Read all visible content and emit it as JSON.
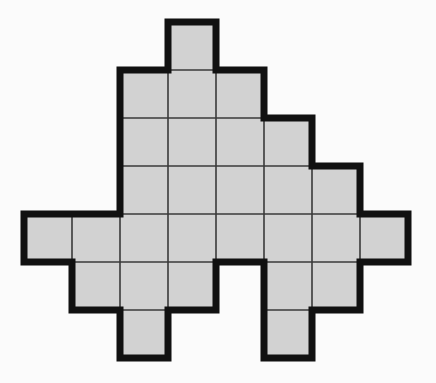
{
  "canvas": {
    "width": 436,
    "height": 383,
    "background_color": "#fbfbfb"
  },
  "figure": {
    "cell_fill_color": "#d2d2d2",
    "outline_color": "#111111",
    "interior_line_color": "#3a3a3a",
    "outline_width": 7,
    "interior_line_width": 1.6,
    "cell_size": 48,
    "origin_x": 24,
    "origin_y": 22,
    "columns": 8,
    "rows": 7,
    "cell_count": 26
  },
  "grid_data": {
    "type": "occupancy-matrix",
    "legend": {
      "1": "filled cell",
      "0": "empty cell"
    },
    "column_labels": [
      "0",
      "1",
      "2",
      "3",
      "4",
      "5",
      "6",
      "7"
    ],
    "row_labels": [
      "0",
      "1",
      "2",
      "3",
      "4",
      "5",
      "6"
    ],
    "matrix": [
      [
        0,
        0,
        0,
        1,
        0,
        0,
        0,
        0
      ],
      [
        0,
        0,
        1,
        1,
        1,
        0,
        0,
        0
      ],
      [
        0,
        0,
        1,
        1,
        1,
        1,
        0,
        0
      ],
      [
        0,
        0,
        1,
        1,
        1,
        1,
        1,
        0
      ],
      [
        1,
        1,
        1,
        1,
        1,
        1,
        1,
        1
      ],
      [
        0,
        1,
        1,
        1,
        0,
        1,
        1,
        0
      ],
      [
        0,
        0,
        1,
        0,
        0,
        1,
        0,
        0
      ]
    ],
    "row_filled_columns": [
      [
        3
      ],
      [
        2,
        3,
        4
      ],
      [
        2,
        3,
        4,
        5
      ],
      [
        2,
        3,
        4,
        5,
        6
      ],
      [
        0,
        1,
        2,
        3,
        4,
        5,
        6,
        7
      ],
      [
        1,
        2,
        3,
        5,
        6
      ],
      [
        2,
        5
      ]
    ],
    "row_counts": [
      1,
      3,
      4,
      5,
      8,
      5,
      2
    ],
    "column_counts": [
      1,
      2,
      6,
      5,
      4,
      5,
      3,
      1
    ]
  }
}
